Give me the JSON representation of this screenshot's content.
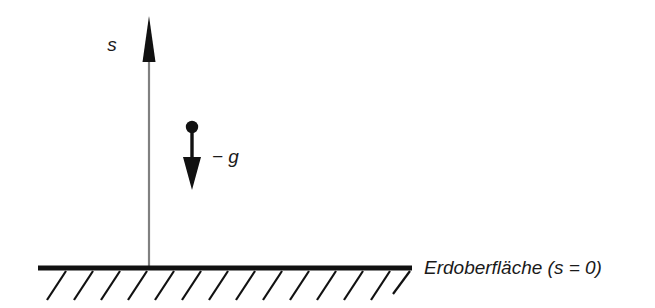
{
  "diagram": {
    "background_color": "#ffffff",
    "axis": {
      "name": "s-axis",
      "label": "s",
      "direction": "up",
      "line_color": "#808080",
      "arrowhead_color": "#111111",
      "x": 149,
      "y_top": 18,
      "y_bottom": 270
    },
    "particle": {
      "name": "point-mass",
      "color": "#111111",
      "x": 192,
      "y": 127,
      "radius": 6
    },
    "acceleration": {
      "name": "acceleration-vector",
      "label": "− g",
      "direction": "down",
      "color": "#111111",
      "x": 192,
      "y_start": 133,
      "y_end": 189,
      "label_x": 212,
      "label_y": 157
    },
    "ground": {
      "name": "ground-line",
      "label": "Erdoberfläche (s = 0)",
      "line_color": "#111111",
      "x_start": 38,
      "x_end": 412,
      "y": 268,
      "thickness": 5,
      "label_x": 424,
      "label_y": 268,
      "hatching": {
        "name": "ground-hatching",
        "color": "#111111",
        "count": 14,
        "spacing": 27,
        "length": 33,
        "angle_deg": 55,
        "start_x": 47
      }
    }
  }
}
